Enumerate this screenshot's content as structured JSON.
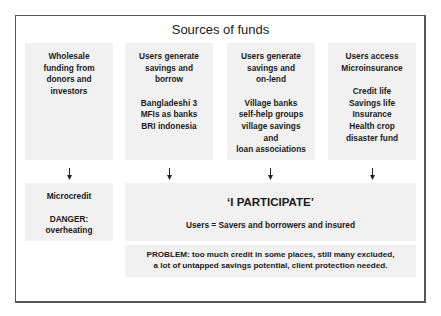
{
  "title": "Sources of funds",
  "columns": [
    {
      "heading": [
        "Wholesale",
        "funding from",
        "donors and",
        "investors"
      ],
      "details": []
    },
    {
      "heading": [
        "Users generate",
        "savings and",
        "borrow"
      ],
      "details": [
        "Bangladeshi 3",
        "MFIs as banks",
        "BRI indonesia"
      ]
    },
    {
      "heading": [
        "Users generate",
        "savings and",
        "on-lend"
      ],
      "details": [
        "Village banks",
        "self-help groups",
        "village savings",
        "and",
        "loan associations"
      ]
    },
    {
      "heading": [
        "Users access",
        "Microinsurance"
      ],
      "details": [
        "Credit life",
        "Savings life",
        "Insurance",
        "Health crop",
        "disaster fund"
      ]
    }
  ],
  "microcredit": {
    "label": "Microcredit",
    "danger": [
      "DANGER:",
      "overheating"
    ]
  },
  "participate": {
    "title": "‘I PARTICIPATE’",
    "subtitle": "Users = Savers and borrowers and insured"
  },
  "problem": {
    "lines": [
      "PROBLEM: too much credit in some places, still many excluded,",
      "a lot of untapped savings potential, client protection needed."
    ]
  },
  "colors": {
    "panel": "#f1f1f1",
    "border": "#555555",
    "text": "#1a1a1a"
  }
}
